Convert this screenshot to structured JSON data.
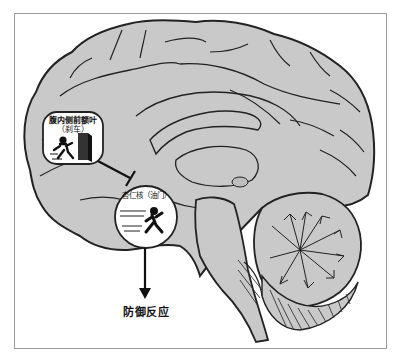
{
  "diagram": {
    "title": "",
    "nodes": [
      {
        "id": "vmpfc",
        "label": "腹内侧前额叶",
        "sublabel": "（刹车）",
        "role": "brake",
        "icon": "running-person-stopping-at-door-icon"
      },
      {
        "id": "amygdala",
        "label": "杏仁核（油门）",
        "role": "accelerator",
        "icon": "running-person-icon"
      }
    ],
    "edges": [
      {
        "from": "vmpfc",
        "to": "amygdala",
        "type": "inhibition"
      },
      {
        "from": "amygdala",
        "to": "defense",
        "type": "arrow"
      }
    ],
    "output_label": "防御反应",
    "colors": {
      "brain_fill": "#c9c9c9",
      "outline": "#222222",
      "frame": "#9a9a9a",
      "background": "#ffffff"
    }
  }
}
